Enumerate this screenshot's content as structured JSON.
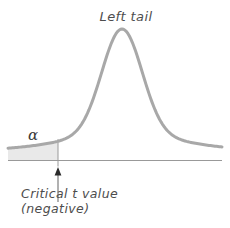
{
  "figure": {
    "title_label": "Left tail",
    "alpha_label": "α",
    "annotation": {
      "line1": "Critical t value",
      "line2": "(negative)"
    },
    "colors": {
      "curve": "#a8a8a8",
      "axis": "#999999",
      "shade": "#e9e9e9",
      "tick": "#999999",
      "arrow_shaft": "#7d7d7d",
      "arrow_head": "#2b2b2b",
      "text": "#4d4d4d"
    },
    "curve": {
      "x_start": 8,
      "x_end": 222,
      "peak_x": 122,
      "peak_y": 29,
      "baseline_y": 150,
      "axis_y": 160.5,
      "critical_x": 58,
      "tick_bottom_y": 166.5,
      "arrow_tip_y": 167,
      "arrow_head_base_y": 175.5,
      "arrow_head_half_width": 3.4,
      "arrow_shaft_top_y": 173,
      "arrow_shaft_bottom_y": 202,
      "components": [
        {
          "a": 105,
          "sigma": 20
        },
        {
          "a": 16,
          "sigma": 55
        }
      ]
    }
  }
}
